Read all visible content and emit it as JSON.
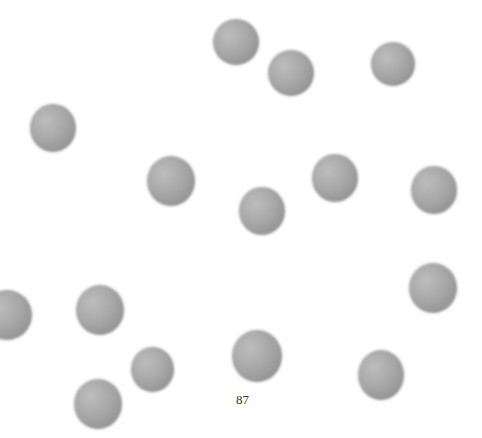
{
  "game": {
    "counter": "87",
    "ball_color": "#a0a0a0",
    "ball_count": 17
  }
}
